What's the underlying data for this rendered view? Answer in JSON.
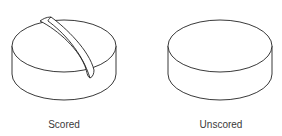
{
  "figure": {
    "tablets": [
      {
        "label": "Scored",
        "has_score_line": true
      },
      {
        "label": "Unscored",
        "has_score_line": false
      }
    ],
    "stroke_color": "#222222",
    "fill_color": "#ffffff",
    "label_color": "#3a3a3a"
  }
}
